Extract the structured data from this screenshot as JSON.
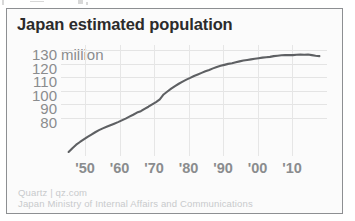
{
  "chart_data": {
    "type": "line",
    "title": "Japan estimated population",
    "xlabel": "",
    "ylabel": "",
    "y_units_label": "million",
    "yticks": [
      130,
      120,
      110,
      100,
      90,
      80
    ],
    "ytick_labels": [
      "130",
      "120",
      "110",
      "100",
      "90",
      "80"
    ],
    "ylim": [
      76,
      133
    ],
    "xlim": [
      1945,
      2015
    ],
    "xticks": [
      1950,
      1960,
      1970,
      1980,
      1990,
      2000,
      2010
    ],
    "xtick_labels": [
      "'50",
      "'60",
      "'70",
      "'80",
      "'90",
      "'00",
      "'10"
    ],
    "grid": "both-light",
    "legend": "none",
    "series": [
      {
        "name": "Japan estimated population",
        "units": "million",
        "color": "#5e6063",
        "x": [
          1947,
          1948,
          1949,
          1950,
          1951,
          1952,
          1953,
          1954,
          1955,
          1956,
          1957,
          1958,
          1959,
          1960,
          1961,
          1962,
          1963,
          1964,
          1965,
          1966,
          1967,
          1968,
          1969,
          1970,
          1971,
          1972,
          1973,
          1974,
          1975,
          1976,
          1977,
          1978,
          1979,
          1980,
          1981,
          1982,
          1983,
          1984,
          1985,
          1986,
          1987,
          1988,
          1989,
          1990,
          1991,
          1992,
          1993,
          1994,
          1995,
          1996,
          1997,
          1998,
          1999,
          2000,
          2001,
          2002,
          2003,
          2004,
          2005,
          2006,
          2007,
          2008,
          2009,
          2010,
          2011,
          2012,
          2013
        ],
        "values": [
          78.1,
          80.0,
          81.8,
          83.2,
          84.5,
          85.8,
          87.0,
          88.2,
          89.3,
          90.2,
          91.0,
          91.8,
          92.6,
          93.4,
          94.3,
          95.2,
          96.2,
          97.2,
          98.3,
          99.0,
          100.2,
          101.3,
          102.5,
          103.7,
          105.1,
          107.6,
          109.1,
          110.6,
          111.9,
          113.1,
          114.2,
          115.2,
          116.1,
          117.1,
          117.9,
          118.7,
          119.5,
          120.2,
          121.0,
          121.7,
          122.3,
          122.8,
          123.3,
          123.6,
          124.1,
          124.6,
          125.0,
          125.3,
          125.6,
          125.9,
          126.2,
          126.5,
          126.7,
          126.9,
          127.3,
          127.5,
          127.7,
          127.8,
          127.8,
          127.8,
          128.0,
          128.1,
          128.0,
          128.1,
          127.8,
          127.5,
          127.3
        ]
      }
    ],
    "annotations": [
      "Line rises steeply from about 78 million just after 1945, reaches 100 million around 1967, flattens in the 2000s near 128 million, then edges down after 2010."
    ]
  },
  "footer": {
    "source_line_1": "Quartz | qz.com",
    "source_line_2": "Japan Ministry of Internal Affairs and Communications"
  },
  "colors": {
    "line": "#5e6063",
    "title_text": "#2b2b2b",
    "axis_text": "#8a8c8e",
    "footer_text": "#c8cacc",
    "grid": "#e6e6e6",
    "card_border": "#8d8f92",
    "card_background": "#fbfbfb"
  }
}
